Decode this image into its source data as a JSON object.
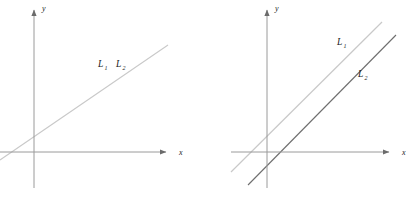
{
  "figure": {
    "background_color": "#ffffff",
    "panels": [
      {
        "id": "left",
        "name": "coincident-lines-panel",
        "axes": {
          "x_label": "x",
          "y_label": "y",
          "axis_color": "#9a9a9a",
          "origin": {
            "x": 34,
            "y": 152
          },
          "x_axis": {
            "x1": 0,
            "y1": 152,
            "x2": 168,
            "y2": 152
          },
          "y_axis": {
            "x1": 34,
            "y1": 188,
            "x2": 34,
            "y2": 8
          }
        },
        "lines": [
          {
            "name": "line-L1-L2-coincident",
            "label": "L",
            "subscript": "1",
            "color": "#c9c9c9",
            "x1": 0,
            "y1": 160,
            "x2": 168,
            "y2": 45
          }
        ],
        "labels": [
          {
            "name": "label-L1",
            "text": "L",
            "sub": "1",
            "x": 98,
            "y": 67
          },
          {
            "name": "label-L2",
            "text": "L",
            "sub": "2",
            "x": 116,
            "y": 67
          }
        ]
      },
      {
        "id": "right",
        "name": "parallel-lines-panel",
        "axes": {
          "x_label": "x",
          "y_label": "y",
          "axis_color": "#9a9a9a",
          "origin": {
            "x": 64,
            "y": 152
          },
          "x_axis": {
            "x1": 28,
            "y1": 152,
            "x2": 196,
            "y2": 152
          },
          "y_axis": {
            "x1": 64,
            "y1": 188,
            "x2": 64,
            "y2": 8
          }
        },
        "lines": [
          {
            "name": "line-L1",
            "label": "L",
            "subscript": "1",
            "color": "#c9c9c9",
            "x1": 28,
            "y1": 172,
            "x2": 179,
            "y2": 22
          },
          {
            "name": "line-L2",
            "label": "L",
            "subscript": "2",
            "color": "#6e6e6e",
            "x1": 45,
            "y1": 185,
            "x2": 193,
            "y2": 35
          }
        ],
        "labels": [
          {
            "name": "label-L1",
            "text": "L",
            "sub": "1",
            "x": 134,
            "y": 45
          },
          {
            "name": "label-L2",
            "text": "L",
            "sub": "2",
            "x": 155,
            "y": 77
          }
        ]
      }
    ]
  }
}
